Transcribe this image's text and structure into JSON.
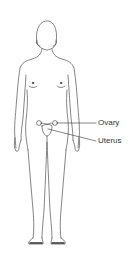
{
  "diagram": {
    "labels": [
      {
        "id": "ovary",
        "text": "Ovary"
      },
      {
        "id": "uterus",
        "text": "Uterus"
      }
    ],
    "colors": {
      "line": "#333333",
      "background": "#ffffff"
    }
  }
}
